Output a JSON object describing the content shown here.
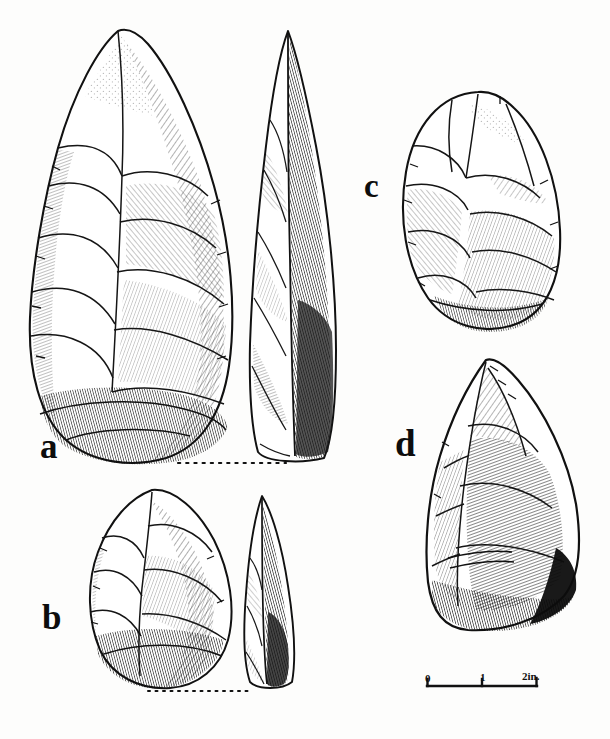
{
  "plate": {
    "kind": "lithic-artifact-illustration-plate",
    "background_color": "#fdfdfc",
    "ink_color": "#111111",
    "width": 610,
    "height": 739
  },
  "figures": [
    {
      "id": "a",
      "label": "a",
      "description": "Large ovate/teardrop handaxe, face view with paired profile view",
      "views": [
        "face",
        "profile"
      ],
      "baseline": "dotted"
    },
    {
      "id": "b",
      "label": "b",
      "description": "Small pointed handaxe, face view with paired profile view",
      "views": [
        "face",
        "profile"
      ],
      "baseline": "dotted"
    },
    {
      "id": "c",
      "label": "c",
      "description": "Oval discoidal core, single face view",
      "views": [
        "face"
      ],
      "baseline": "none"
    },
    {
      "id": "d",
      "label": "d",
      "description": "Triangular pointed flake, single face view",
      "views": [
        "face"
      ],
      "baseline": "none"
    }
  ],
  "scale_bar": {
    "ticks": [
      "0",
      "1",
      "2in."
    ],
    "unit": "in.",
    "length_inches": 2,
    "pixel_length": 110
  }
}
